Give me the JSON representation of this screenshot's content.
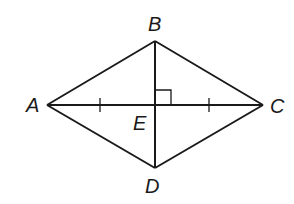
{
  "diagram": {
    "type": "geometry",
    "shape": "rhombus with diagonals",
    "stroke_color": "#1a1a1a",
    "background": "#ffffff",
    "vertices": {
      "A": {
        "label": "A",
        "x": 47,
        "y": 105
      },
      "B": {
        "label": "B",
        "x": 155,
        "y": 41
      },
      "C": {
        "label": "C",
        "x": 263,
        "y": 105
      },
      "D": {
        "label": "D",
        "x": 155,
        "y": 168
      },
      "E": {
        "label": "E",
        "x": 155,
        "y": 105
      }
    },
    "segments": [
      "AB",
      "BC",
      "CD",
      "DA",
      "AC",
      "BD"
    ],
    "annotations": {
      "right_angle_at": "E",
      "congruent_ticks": [
        "AE",
        "EC"
      ]
    }
  }
}
